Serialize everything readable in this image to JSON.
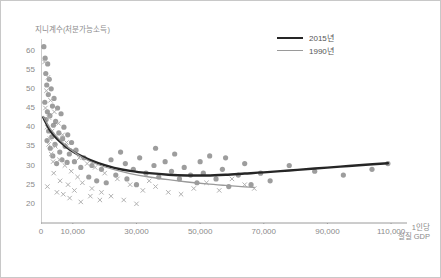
{
  "chart_data": {
    "type": "scatter",
    "title": "",
    "ylabel": "지니계수(처분가능소득)",
    "xlabel": "1인당\n실질 GDP",
    "xlabel_line1": "1인당",
    "xlabel_line2": "실질 GDP",
    "xlim": [
      0,
      115000
    ],
    "ylim": [
      15,
      63
    ],
    "xticks": [
      0,
      10000,
      30000,
      50000,
      70000,
      90000,
      110000
    ],
    "xtick_labels": [
      "0",
      "10,000",
      "30,000",
      "50,000",
      "70,000",
      "90,000",
      "110,000"
    ],
    "yticks": [
      20,
      25,
      30,
      35,
      40,
      45,
      50,
      55,
      60
    ],
    "ytick_labels": [
      "20",
      "25",
      "30",
      "35",
      "40",
      "45",
      "50",
      "55",
      "60"
    ],
    "grid": false,
    "legend_position": "top-right",
    "colors": {
      "points_2015": "#8c8c8c",
      "points_1990": "#a8a8a8",
      "line_2015": "#262626",
      "line_1990": "#9a9a9a",
      "axis": "#9a9a9a",
      "text": "#8a8a8a",
      "border": "#c8c8c8"
    },
    "series": [
      {
        "name": "2015년",
        "type": "line",
        "color": "#262626",
        "width": 2.4,
        "points": [
          [
            700,
            42.6
          ],
          [
            3000,
            39.0
          ],
          [
            6000,
            36.2
          ],
          [
            9000,
            34.2
          ],
          [
            13000,
            32.3
          ],
          [
            18000,
            30.6
          ],
          [
            23000,
            29.4
          ],
          [
            28000,
            28.6
          ],
          [
            34000,
            28.0
          ],
          [
            40000,
            27.6
          ],
          [
            46000,
            27.4
          ],
          [
            52000,
            27.4
          ],
          [
            58000,
            27.6
          ],
          [
            64000,
            27.9
          ],
          [
            70000,
            28.2
          ],
          [
            78000,
            28.7
          ],
          [
            86000,
            29.2
          ],
          [
            94000,
            29.7
          ],
          [
            102000,
            30.2
          ],
          [
            109000,
            30.6
          ]
        ]
      },
      {
        "name": "1990년",
        "type": "line",
        "color": "#9a9a9a",
        "width": 1.3,
        "points": [
          [
            700,
            42.8
          ],
          [
            3000,
            39.5
          ],
          [
            6000,
            36.6
          ],
          [
            9000,
            34.4
          ],
          [
            13000,
            32.1
          ],
          [
            18000,
            30.2
          ],
          [
            23000,
            28.9
          ],
          [
            28000,
            27.9
          ],
          [
            34000,
            27.0
          ],
          [
            40000,
            26.3
          ],
          [
            46000,
            25.7
          ],
          [
            52000,
            25.2
          ],
          [
            58000,
            24.8
          ],
          [
            63000,
            24.5
          ],
          [
            67000,
            24.3
          ]
        ]
      },
      {
        "name": "2015년 관측치",
        "type": "scatter",
        "marker": "circle",
        "color": "#8c8c8c",
        "points": [
          [
            900,
            61.0
          ],
          [
            1300,
            58.0
          ],
          [
            2100,
            56.5
          ],
          [
            1500,
            54.0
          ],
          [
            2600,
            52.5
          ],
          [
            1800,
            51.0
          ],
          [
            3200,
            50.0
          ],
          [
            2300,
            48.5
          ],
          [
            4100,
            47.5
          ],
          [
            1200,
            46.5
          ],
          [
            3600,
            45.5
          ],
          [
            5200,
            45.0
          ],
          [
            2000,
            44.0
          ],
          [
            2800,
            43.0
          ],
          [
            6300,
            43.5
          ],
          [
            1600,
            42.0
          ],
          [
            4600,
            41.5
          ],
          [
            3900,
            40.5
          ],
          [
            7200,
            40.0
          ],
          [
            2400,
            39.0
          ],
          [
            5600,
            38.5
          ],
          [
            8400,
            38.0
          ],
          [
            3400,
            37.5
          ],
          [
            6800,
            37.0
          ],
          [
            1900,
            36.5
          ],
          [
            9600,
            36.0
          ],
          [
            4400,
            35.5
          ],
          [
            7600,
            35.0
          ],
          [
            2900,
            34.5
          ],
          [
            11000,
            34.0
          ],
          [
            5900,
            33.5
          ],
          [
            8900,
            33.0
          ],
          [
            3700,
            32.5
          ],
          [
            13500,
            32.0
          ],
          [
            6600,
            31.5
          ],
          [
            10500,
            31.0
          ],
          [
            4900,
            30.5
          ],
          [
            16000,
            30.0
          ],
          [
            8200,
            30.8
          ],
          [
            12500,
            29.5
          ],
          [
            19000,
            29.0
          ],
          [
            22000,
            31.5
          ],
          [
            25000,
            33.5
          ],
          [
            26500,
            30.5
          ],
          [
            29000,
            29.0
          ],
          [
            31000,
            32.0
          ],
          [
            33000,
            28.0
          ],
          [
            35500,
            30.0
          ],
          [
            37000,
            27.0
          ],
          [
            39000,
            31.0
          ],
          [
            41000,
            28.5
          ],
          [
            43500,
            26.5
          ],
          [
            45000,
            29.5
          ],
          [
            47000,
            27.5
          ],
          [
            49000,
            25.5
          ],
          [
            51000,
            28.0
          ],
          [
            53000,
            32.5
          ],
          [
            55000,
            26.5
          ],
          [
            57000,
            29.0
          ],
          [
            59000,
            24.5
          ],
          [
            62000,
            27.5
          ],
          [
            64000,
            30.5
          ],
          [
            66000,
            25.0
          ],
          [
            69000,
            28.0
          ],
          [
            72000,
            26.0
          ],
          [
            78000,
            30.0
          ],
          [
            86000,
            28.5
          ],
          [
            95000,
            27.5
          ],
          [
            104000,
            29.0
          ],
          [
            109000,
            30.5
          ],
          [
            15000,
            27.0
          ],
          [
            17500,
            26.0
          ],
          [
            20500,
            25.5
          ],
          [
            23500,
            27.5
          ],
          [
            27000,
            26.5
          ],
          [
            30000,
            25.0
          ],
          [
            36000,
            34.5
          ],
          [
            42000,
            33.0
          ],
          [
            50000,
            31.0
          ],
          [
            58000,
            32.0
          ]
        ]
      },
      {
        "name": "1990년 관측치",
        "type": "scatter",
        "marker": "cross",
        "color": "#b0b0b0",
        "points": [
          [
            1100,
            57.0
          ],
          [
            2200,
            53.0
          ],
          [
            1700,
            49.5
          ],
          [
            3000,
            47.0
          ],
          [
            1400,
            45.0
          ],
          [
            4200,
            44.0
          ],
          [
            2500,
            42.5
          ],
          [
            5500,
            41.0
          ],
          [
            1900,
            40.0
          ],
          [
            3500,
            39.0
          ],
          [
            6800,
            38.0
          ],
          [
            2800,
            37.0
          ],
          [
            8000,
            36.0
          ],
          [
            4500,
            35.0
          ],
          [
            10000,
            34.0
          ],
          [
            3200,
            33.0
          ],
          [
            12000,
            32.0
          ],
          [
            5800,
            31.5
          ],
          [
            14500,
            30.5
          ],
          [
            7500,
            30.0
          ],
          [
            17000,
            29.5
          ],
          [
            9500,
            28.5
          ],
          [
            20000,
            28.0
          ],
          [
            11500,
            27.0
          ],
          [
            24000,
            26.5
          ],
          [
            13000,
            25.5
          ],
          [
            28000,
            25.0
          ],
          [
            16000,
            24.0
          ],
          [
            32000,
            23.5
          ],
          [
            19000,
            23.0
          ],
          [
            36000,
            24.5
          ],
          [
            22000,
            22.0
          ],
          [
            40000,
            23.0
          ],
          [
            26000,
            21.0
          ],
          [
            44000,
            22.5
          ],
          [
            30000,
            20.0
          ],
          [
            48000,
            24.0
          ],
          [
            34000,
            26.0
          ],
          [
            52000,
            25.5
          ],
          [
            56000,
            23.5
          ],
          [
            60000,
            26.5
          ],
          [
            64000,
            25.0
          ],
          [
            67000,
            24.0
          ],
          [
            2000,
            24.5
          ],
          [
            5000,
            23.0
          ],
          [
            7000,
            22.5
          ],
          [
            9000,
            21.5
          ],
          [
            12500,
            20.5
          ],
          [
            15500,
            22.0
          ],
          [
            18500,
            21.0
          ],
          [
            6000,
            26.0
          ],
          [
            4000,
            28.0
          ],
          [
            8500,
            25.0
          ],
          [
            10500,
            23.5
          ],
          [
            3800,
            31.0
          ],
          [
            2400,
            35.5
          ]
        ]
      }
    ]
  },
  "legend": {
    "items": [
      {
        "label": "2015년",
        "color": "#262626",
        "width": 2.4
      },
      {
        "label": "1990년",
        "color": "#9a9a9a",
        "width": 1.3
      }
    ]
  }
}
